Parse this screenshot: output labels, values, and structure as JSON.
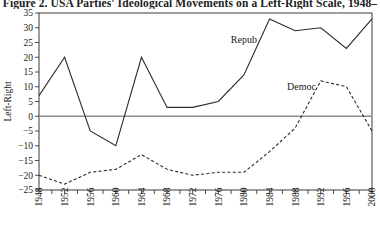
{
  "figure": {
    "title": "Figure 2.  USA Parties' Ideological Movements on a Left-Right Scale, 1948–",
    "ylabel": "Left-Right"
  },
  "chart_data": {
    "type": "line",
    "title": "Figure 2.  USA Parties' Ideological Movements on a Left-Right Scale, 1948–",
    "xlabel": "",
    "ylabel": "Left-Right",
    "xlim": [
      1948,
      2000
    ],
    "ylim": [
      -25,
      35
    ],
    "grid": false,
    "legend": "inline-annotations",
    "yticks": [
      -25,
      -20,
      -15,
      -10,
      -5,
      0,
      5,
      10,
      15,
      20,
      25,
      30,
      35
    ],
    "ytick_labels": [
      "−25",
      "−20",
      "−15",
      "−10",
      "−5",
      "0",
      "5",
      "10",
      "15",
      "20",
      "25",
      "30",
      "35"
    ],
    "xticks": [
      1948,
      1952,
      1956,
      1960,
      1964,
      1968,
      1972,
      1976,
      1980,
      1984,
      1988,
      1992,
      1996,
      2000
    ],
    "xtick_labels": [
      "1948",
      "1952",
      "1956",
      "1960",
      "1964",
      "1968",
      "1972",
      "1976",
      "1980",
      "1984",
      "1988",
      "1992",
      "1996",
      "2000"
    ],
    "x": [
      1948,
      1952,
      1956,
      1960,
      1964,
      1968,
      1972,
      1976,
      1980,
      1984,
      1988,
      1992,
      1996,
      2000
    ],
    "zero_line": 0,
    "series": [
      {
        "name": "Repub",
        "style": "solid",
        "label_x": 1980,
        "label_y": 25,
        "values": [
          7,
          20,
          -5,
          -10,
          20,
          3,
          3,
          5,
          14,
          33,
          29,
          30,
          23,
          33
        ]
      },
      {
        "name": "Democ",
        "style": "dashed",
        "label_x": 1989,
        "label_y": 9,
        "values": [
          -20,
          -23,
          -19,
          -18,
          -13,
          -18,
          -20,
          -19,
          -19,
          -12,
          -4,
          12,
          10,
          -5
        ]
      }
    ]
  }
}
